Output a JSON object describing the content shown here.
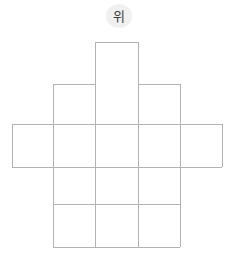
{
  "figure": {
    "kind": "cube-net-diagram",
    "label_badge": {
      "text": "위",
      "meaning": "top",
      "background_color": "#f0f0f0",
      "text_color": "#3a3a3a"
    },
    "stroke_color": "#b3b3b3",
    "fill_color": "#ffffff",
    "background_color": "#ffffff",
    "stroke_width": 1,
    "cell_size_px": 42.5,
    "grid": {
      "columns_x": [
        12,
        53,
        95.5,
        138,
        180,
        222
      ],
      "rows_y": [
        42,
        84,
        124,
        167,
        204,
        247
      ]
    },
    "cells": [
      {
        "name": "top-flap",
        "col": 2,
        "row": 0,
        "x": 95.5,
        "y": 42,
        "w": 42.5,
        "h": 42
      },
      {
        "name": "body-r1c1",
        "col": 1,
        "row": 1,
        "x": 53,
        "y": 84,
        "w": 42.5,
        "h": 40
      },
      {
        "name": "body-r1c2",
        "col": 2,
        "row": 1,
        "x": 95.5,
        "y": 84,
        "w": 42.5,
        "h": 40
      },
      {
        "name": "body-r1c3",
        "col": 3,
        "row": 1,
        "x": 138,
        "y": 84,
        "w": 42,
        "h": 40
      },
      {
        "name": "band-left-flap",
        "col": 0,
        "row": 2,
        "x": 12,
        "y": 124,
        "w": 41,
        "h": 43
      },
      {
        "name": "band-r2c1",
        "col": 1,
        "row": 2,
        "x": 53,
        "y": 124,
        "w": 42.5,
        "h": 43
      },
      {
        "name": "band-r2c2",
        "col": 2,
        "row": 2,
        "x": 95.5,
        "y": 124,
        "w": 42.5,
        "h": 43
      },
      {
        "name": "band-r2c3",
        "col": 3,
        "row": 2,
        "x": 138,
        "y": 124,
        "w": 42,
        "h": 43
      },
      {
        "name": "band-right-flap",
        "col": 4,
        "row": 2,
        "x": 180,
        "y": 124,
        "w": 42,
        "h": 43
      },
      {
        "name": "body-r3c1",
        "col": 1,
        "row": 3,
        "x": 53,
        "y": 167,
        "w": 42.5,
        "h": 37
      },
      {
        "name": "body-r3c2",
        "col": 2,
        "row": 3,
        "x": 95.5,
        "y": 167,
        "w": 42.5,
        "h": 37
      },
      {
        "name": "body-r3c3",
        "col": 3,
        "row": 3,
        "x": 138,
        "y": 167,
        "w": 42,
        "h": 37
      },
      {
        "name": "body-r4c1",
        "col": 1,
        "row": 4,
        "x": 53,
        "y": 204,
        "w": 42.5,
        "h": 43
      },
      {
        "name": "body-r4c2",
        "col": 2,
        "row": 4,
        "x": 95.5,
        "y": 204,
        "w": 42.5,
        "h": 43
      },
      {
        "name": "body-r4c3",
        "col": 3,
        "row": 4,
        "x": 138,
        "y": 204,
        "w": 42,
        "h": 43
      }
    ],
    "strokes": [
      {
        "name": "top-flap-left",
        "x1": 95.5,
        "y1": 42,
        "x2": 95.5,
        "y2": 84
      },
      {
        "name": "top-flap-top",
        "x1": 95.5,
        "y1": 42,
        "x2": 138,
        "y2": 42
      },
      {
        "name": "top-flap-right",
        "x1": 138,
        "y1": 42,
        "x2": 138,
        "y2": 84
      },
      {
        "name": "body-top-left-seg",
        "x1": 53,
        "y1": 84,
        "x2": 95.5,
        "y2": 84
      },
      {
        "name": "body-top-right-seg",
        "x1": 138,
        "y1": 84,
        "x2": 180,
        "y2": 84
      },
      {
        "name": "band-top",
        "x1": 12,
        "y1": 124,
        "x2": 222,
        "y2": 124
      },
      {
        "name": "band-bottom",
        "x1": 12,
        "y1": 167,
        "x2": 222,
        "y2": 167
      },
      {
        "name": "band-left-end",
        "x1": 12,
        "y1": 124,
        "x2": 12,
        "y2": 167
      },
      {
        "name": "band-right-end",
        "x1": 222,
        "y1": 124,
        "x2": 222,
        "y2": 167
      },
      {
        "name": "row3-divider",
        "x1": 53,
        "y1": 204,
        "x2": 180,
        "y2": 204
      },
      {
        "name": "body-bottom",
        "x1": 53,
        "y1": 247,
        "x2": 180,
        "y2": 247
      },
      {
        "name": "body-left-edge",
        "x1": 53,
        "y1": 84,
        "x2": 53,
        "y2": 247
      },
      {
        "name": "col2-line",
        "x1": 95.5,
        "y1": 84,
        "x2": 95.5,
        "y2": 247
      },
      {
        "name": "col3-line",
        "x1": 138,
        "y1": 84,
        "x2": 138,
        "y2": 247
      },
      {
        "name": "body-right-edge",
        "x1": 180,
        "y1": 84,
        "x2": 180,
        "y2": 247
      }
    ]
  }
}
